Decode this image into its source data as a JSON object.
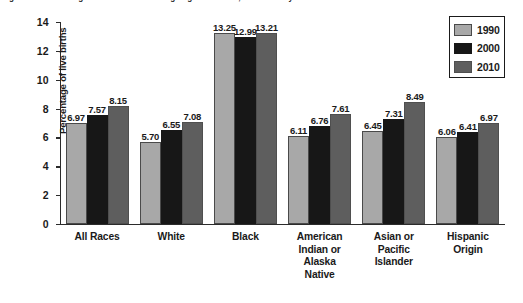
{
  "chart_data": {
    "type": "bar",
    "title": "Figure 3-5. Percentage of US Live Births Weighing Less than 2,500 Grams by Mother's Detailed Race",
    "xlabel": "",
    "ylabel": "Percentage of live births",
    "ylim": [
      0,
      14
    ],
    "yticks": [
      0,
      2,
      4,
      6,
      8,
      10,
      12,
      14
    ],
    "grid": false,
    "legend_position": "top-right",
    "categories": [
      "All Races",
      "White",
      "Black",
      "American Indian or Alaska Native",
      "Asian or Pacific Islander",
      "Hispanic Origin"
    ],
    "category_lines": [
      [
        "All Races"
      ],
      [
        "White"
      ],
      [
        "Black"
      ],
      [
        "American",
        "Indian or",
        "Alaska",
        "Native"
      ],
      [
        "Asian or",
        "Pacific",
        "Islander"
      ],
      [
        "Hispanic",
        "Origin"
      ]
    ],
    "series": [
      {
        "name": "1990",
        "color": "#a8a8a8",
        "values": [
          6.97,
          5.7,
          13.25,
          6.11,
          6.45,
          6.06
        ],
        "labels": [
          "6.97",
          "5.70",
          "13.25",
          "6.11",
          "6.45",
          "6.06"
        ]
      },
      {
        "name": "2000",
        "color": "#171717",
        "values": [
          7.57,
          6.55,
          12.99,
          6.76,
          7.31,
          6.41
        ],
        "labels": [
          "7.57",
          "6.55",
          "12.99",
          "6.76",
          "7.31",
          "6.41"
        ]
      },
      {
        "name": "2010",
        "color": "#5e5e5e",
        "values": [
          8.15,
          7.08,
          13.21,
          7.61,
          8.49,
          6.97
        ],
        "labels": [
          "8.15",
          "7.08",
          "13.21",
          "7.61",
          "8.49",
          "6.97"
        ]
      }
    ]
  },
  "legend": {
    "items": [
      {
        "label": "1990"
      },
      {
        "label": "2000"
      },
      {
        "label": "2010"
      }
    ]
  },
  "axis": {
    "y_title": "Percentage of live births",
    "y_tick_labels": [
      "14",
      "12",
      "10",
      "8",
      "6",
      "4",
      "2",
      "0"
    ]
  }
}
